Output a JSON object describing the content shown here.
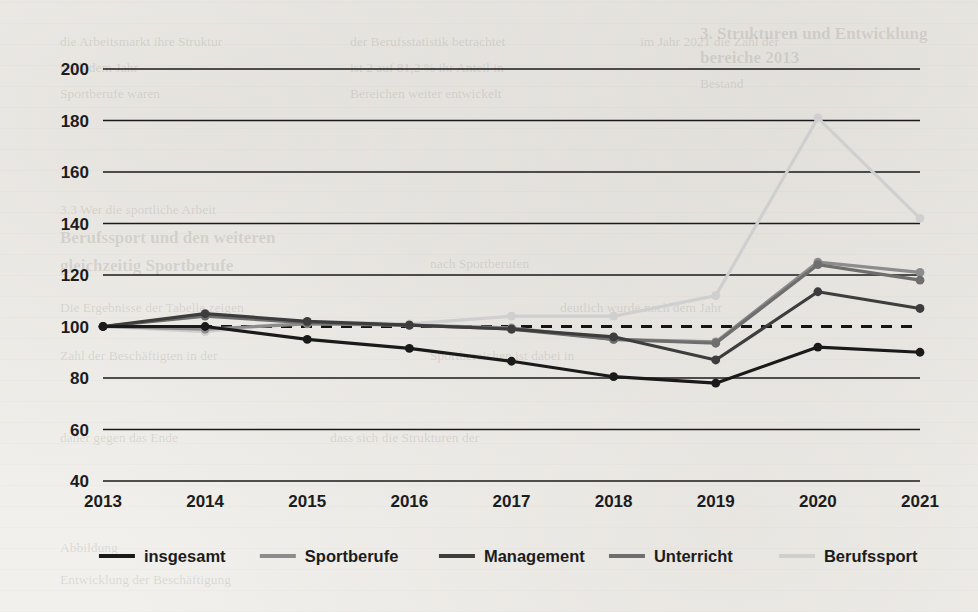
{
  "chart_data": {
    "type": "line",
    "title": "",
    "subtitle": "",
    "xlabel": "",
    "ylabel": "",
    "x": [
      2013,
      2014,
      2015,
      2016,
      2017,
      2018,
      2019,
      2020,
      2021
    ],
    "xtick_labels": [
      "2013",
      "2014",
      "2015",
      "2016",
      "2017",
      "2018",
      "2019",
      "2020",
      "2021"
    ],
    "ytick_labels": [
      "40",
      "60",
      "80",
      "100",
      "120",
      "140",
      "160",
      "180",
      "200"
    ],
    "yticks": [
      40,
      60,
      80,
      100,
      120,
      140,
      160,
      180,
      200
    ],
    "ylim": [
      40,
      200
    ],
    "grid": "horizontal",
    "legend_position": "bottom",
    "baseline": {
      "value": 100,
      "style": "dashed",
      "color": "#141414"
    },
    "series": [
      {
        "name": "insgesamt",
        "color": "#1a1a1a",
        "width": 3.2,
        "markers": true,
        "values": [
          100,
          100,
          95,
          91.5,
          86.5,
          80.5,
          78,
          92,
          90
        ]
      },
      {
        "name": "Sportberufe",
        "color": "#8c8c8c",
        "width": 3.2,
        "markers": true,
        "values": [
          100,
          99,
          101,
          100.5,
          99.5,
          95,
          94,
          125,
          121
        ]
      },
      {
        "name": "Management",
        "color": "#3d3d3d",
        "width": 3.2,
        "markers": true,
        "values": [
          100,
          105,
          102,
          100.5,
          99,
          96,
          87,
          113.5,
          107
        ]
      },
      {
        "name": "Unterricht",
        "color": "#6e6e6e",
        "width": 3.2,
        "markers": true,
        "values": [
          100,
          104,
          101.5,
          100.5,
          99,
          95,
          93.5,
          124,
          118
        ]
      },
      {
        "name": "Berufssport",
        "color": "#cfcfcf",
        "width": 3.2,
        "markers": true,
        "values": [
          100,
          98,
          102,
          101,
          104,
          104,
          112,
          181,
          142
        ]
      }
    ]
  },
  "legend": {
    "items": [
      {
        "label": "insgesamt",
        "color": "#1a1a1a"
      },
      {
        "label": "Sportberufe",
        "color": "#8c8c8c"
      },
      {
        "label": "Management",
        "color": "#3d3d3d"
      },
      {
        "label": "Unterricht",
        "color": "#6e6e6e"
      },
      {
        "label": "Berufssport",
        "color": "#cfcfcf"
      }
    ]
  },
  "page_background_text": [
    {
      "text": "3. Strukturen und Entwicklung",
      "x": 700,
      "y": 24,
      "bold": true
    },
    {
      "text": "bereiche 2013",
      "x": 700,
      "y": 48,
      "bold": true
    },
    {
      "text": "Bestand",
      "x": 700,
      "y": 76,
      "bold": false
    },
    {
      "text": "die Arbeitsmarkt ihre Struktur",
      "x": 60,
      "y": 34,
      "bold": false
    },
    {
      "text": "der Berufsstatistik betrachtet",
      "x": 350,
      "y": 34,
      "bold": false
    },
    {
      "text": "im Jahr 2021 die Zahl der",
      "x": 640,
      "y": 34,
      "bold": false
    },
    {
      "text": "nach dem Jahr",
      "x": 60,
      "y": 60,
      "bold": false
    },
    {
      "text": "ist 2 auf 81,2 % ihr Anteil in",
      "x": 350,
      "y": 60,
      "bold": false
    },
    {
      "text": "Sportberufe waren",
      "x": 60,
      "y": 86,
      "bold": false
    },
    {
      "text": "Bereichen weiter entwickelt",
      "x": 350,
      "y": 86,
      "bold": false
    },
    {
      "text": "3.3 Wer die sportliche Arbeit",
      "x": 60,
      "y": 202,
      "bold": false
    },
    {
      "text": "Berufssport und den weiteren",
      "x": 60,
      "y": 228,
      "bold": true
    },
    {
      "text": "gleichzeitig Sportberufe",
      "x": 60,
      "y": 256,
      "bold": true
    },
    {
      "text": "nach Sportberufen",
      "x": 430,
      "y": 256,
      "bold": false
    },
    {
      "text": "Die Ergebnisse der Tabelle zeigen",
      "x": 60,
      "y": 300,
      "bold": false
    },
    {
      "text": "deutlich wurde nach dem Jahr",
      "x": 560,
      "y": 300,
      "bold": false
    },
    {
      "text": "Zahl der Beschäftigten in der",
      "x": 60,
      "y": 348,
      "bold": false
    },
    {
      "text": "Sportbereichen ist dabei in",
      "x": 430,
      "y": 348,
      "bold": false
    },
    {
      "text": "daher gegen das Ende",
      "x": 60,
      "y": 430,
      "bold": false
    },
    {
      "text": "dass sich die Strukturen der",
      "x": 330,
      "y": 430,
      "bold": false
    },
    {
      "text": "Abbildung",
      "x": 60,
      "y": 540,
      "bold": false
    },
    {
      "text": "Entwicklung der Beschäftigung",
      "x": 60,
      "y": 572,
      "bold": false
    }
  ]
}
